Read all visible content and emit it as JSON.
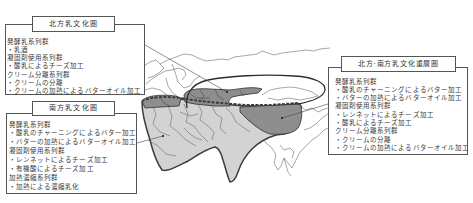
{
  "map": {
    "colors": {
      "south_area_fill": "#d3d3d3",
      "overlap_area_fill": "#8e8e8e",
      "outline": "#3c3c3c"
    }
  },
  "north_area": {
    "title": "北方乳文化圏",
    "groups": [
      {
        "heading": "発酵乳系列群",
        "items": [
          "・乳酒"
        ]
      },
      {
        "heading": "凝固剤使用系列群",
        "items": [
          "・酸乳によるチーズ加工"
        ]
      },
      {
        "heading": "クリーム分離系列群",
        "items": [
          "・クリームの分離",
          "・クリームの加熱によるバターオイル加工"
        ]
      }
    ]
  },
  "south_area": {
    "title": "南方乳文化圏",
    "groups": [
      {
        "heading": "発酵乳系列群",
        "items": [
          "・酸乳のチャーニングによるバター加工",
          "・バターの加熱によるバターオイル加工"
        ]
      },
      {
        "heading": "凝固剤使用系列群",
        "items": [
          "・レンネットによるチーズ加工",
          "・有機酸によるチーズ加工"
        ]
      },
      {
        "heading": "加熱濃縮系列群",
        "items": [
          "・加熱による濃縮乳化"
        ]
      }
    ]
  },
  "overlap_area": {
    "title": "北方·南方乳文化重層圏",
    "groups": [
      {
        "heading": "発酵乳系列群",
        "items": [
          "・酸乳のチャーニングによるバター加工",
          "・バターの加熱によるバターオイル加工"
        ]
      },
      {
        "heading": "凝固剤使用系列群",
        "items": [
          "・レンネットによるチーズ加工",
          "・酸乳によるチーズ加工"
        ]
      },
      {
        "heading": "クリーム分離系列群",
        "items": [
          "・クリームの分離",
          "・クリームの加熱によるバターオイル加工"
        ]
      }
    ]
  }
}
